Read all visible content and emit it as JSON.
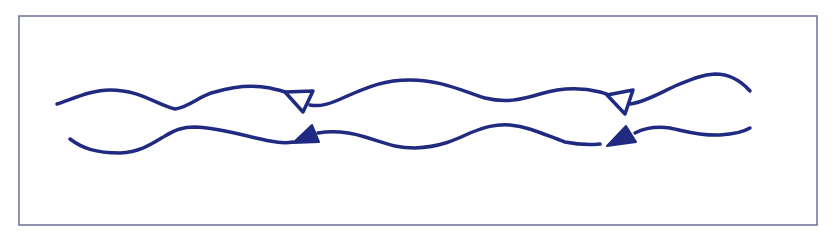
{
  "diagram": {
    "title": "",
    "colors": {
      "line": "#1f2a80",
      "frame": "#6a6f9a",
      "background": "#ffffff"
    },
    "lines": [
      {
        "id": "upper-line",
        "markers": [
          {
            "style": "open",
            "direction": "left"
          },
          {
            "style": "open",
            "direction": "left"
          }
        ]
      },
      {
        "id": "lower-line",
        "markers": [
          {
            "style": "filled",
            "direction": "left"
          },
          {
            "style": "filled",
            "direction": "left"
          }
        ]
      }
    ]
  }
}
